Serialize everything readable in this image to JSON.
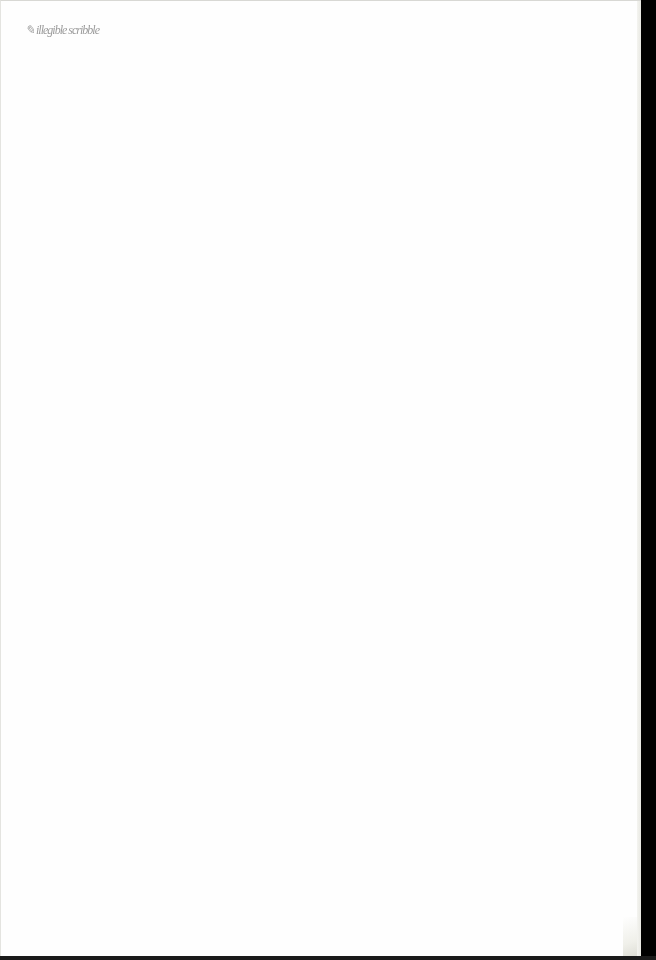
{
  "document": {
    "type": "scanned blank page",
    "handwritten_note": {
      "text": "✎ illegible scribble",
      "legible": false
    }
  },
  "colors": {
    "paper": "#fefefe",
    "scan_background": "#000000",
    "ink": "#7a7a7a"
  }
}
